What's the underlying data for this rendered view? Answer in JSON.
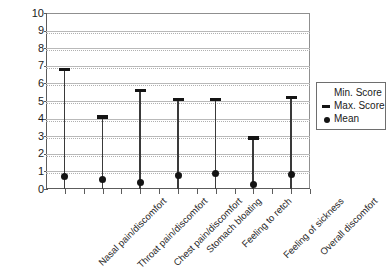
{
  "chart_data": {
    "type": "bar",
    "subtype": "min-max-mean range plot",
    "title": "",
    "xlabel": "",
    "ylabel": "",
    "ylim": [
      0,
      10
    ],
    "yticks": [
      0,
      1,
      2,
      3,
      4,
      5,
      6,
      7,
      8,
      9,
      10
    ],
    "ytick_labels": [
      "0",
      "1",
      "2",
      "3",
      "4",
      "5",
      "6",
      "7",
      "8",
      "9",
      "10"
    ],
    "grid": true,
    "legend_position": "right",
    "categories": [
      "Nasal pain/discomfort",
      "Throat pain/discomfort",
      "Chest pain/discomfort",
      "Stomach bloating",
      "Feeling to retch",
      "Feeling of sickness",
      "Overall discomfort"
    ],
    "series": [
      {
        "name": "Min. Score",
        "marker": "none",
        "values": [
          0,
          0,
          0,
          0,
          0,
          0,
          0
        ]
      },
      {
        "name": "Max. Score",
        "marker": "dash",
        "values": [
          6.8,
          4.1,
          5.6,
          5.1,
          5.1,
          2.9,
          5.2
        ]
      },
      {
        "name": "Mean",
        "marker": "dot",
        "values": [
          0.7,
          0.55,
          0.35,
          0.75,
          0.9,
          0.25,
          0.8
        ]
      }
    ]
  },
  "legend": {
    "items": [
      {
        "label": "Min. Score",
        "marker": "none"
      },
      {
        "label": "Max. Score",
        "marker": "dash"
      },
      {
        "label": "Mean",
        "marker": "dot"
      }
    ]
  },
  "colors": {
    "marker": "#141414",
    "line": "#3a3a3a",
    "grid": "#b9b9b9",
    "axis": "#5c5c5c",
    "background": "#ffffff"
  }
}
